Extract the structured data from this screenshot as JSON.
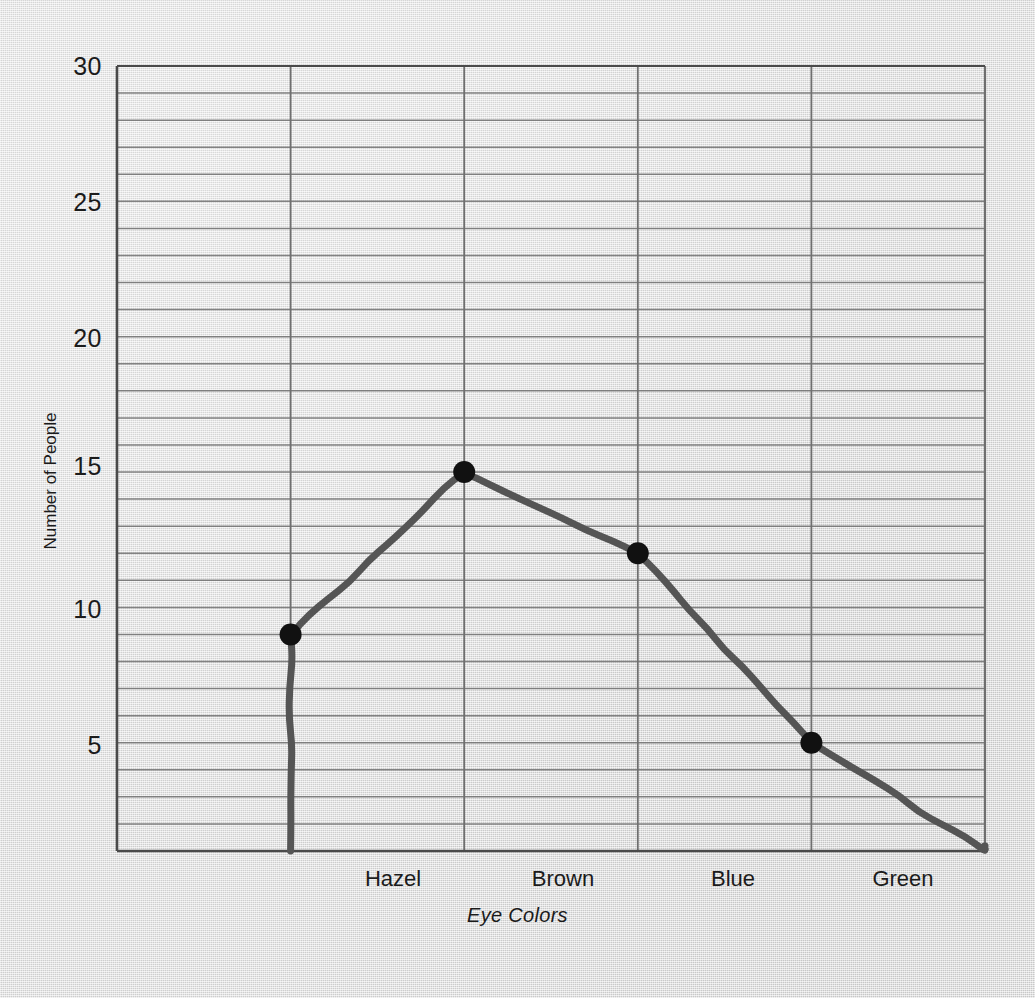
{
  "chart_data": {
    "type": "line",
    "title": "",
    "xlabel": "Eye Colors",
    "ylabel": "Number of People",
    "categories": [
      "Hazel",
      "Brown",
      "Blue",
      "Green"
    ],
    "values": [
      9,
      15,
      12,
      5
    ],
    "series": [
      {
        "name": "Number of People",
        "values": [
          9,
          15,
          12,
          5
        ]
      }
    ],
    "ylim": [
      1,
      30
    ],
    "xlim": [
      0,
      5
    ],
    "y_tick_labels": [
      "30",
      "25",
      "20",
      "15",
      "10",
      "5"
    ],
    "y_tick_values": [
      30,
      25,
      20,
      15,
      10,
      5
    ],
    "y_gridline_step": 1,
    "x_gridline_positions": [
      1,
      2,
      3,
      4,
      5
    ],
    "grid": true,
    "legend": "none",
    "marker": "filled-circle",
    "line_style": "hand-drawn",
    "line_extends_to_axes": true,
    "left_line_endpoint": {
      "x": 1,
      "y": 1
    },
    "right_line_endpoint": {
      "x": 5,
      "y": 1
    },
    "colors": {
      "background": "#dcdcdc",
      "line": "#555555",
      "marker": "#111111",
      "grid": "#6f6f6f",
      "axis": "#4a4a4a",
      "text": "#1b1b1b"
    }
  },
  "figure": {
    "y_axis_title": "Number of People",
    "x_axis_title": "Eye Colors"
  }
}
